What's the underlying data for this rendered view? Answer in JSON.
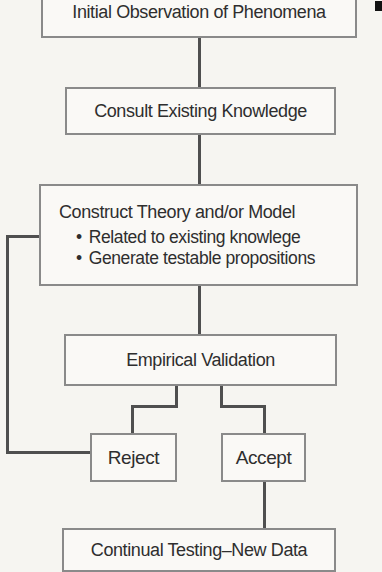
{
  "flowchart": {
    "bullet_char": "•",
    "nodes": {
      "initial": {
        "label": "Initial Observation of Phenomena"
      },
      "consult": {
        "label": "Consult Existing Knowledge"
      },
      "construct": {
        "title": "Construct Theory and/or Model",
        "bullets": [
          "Related to existing knowlege",
          "Generate testable propositions"
        ]
      },
      "empirical": {
        "label": "Empirical Validation"
      },
      "reject": {
        "label": "Reject"
      },
      "accept": {
        "label": "Accept"
      },
      "continual": {
        "label": "Continual Testing–New Data"
      }
    },
    "colors": {
      "connector": "#4f4f4f",
      "box_border": "#8a8a8a",
      "text": "#2e2e2e",
      "background": "#f6f5f1"
    }
  }
}
